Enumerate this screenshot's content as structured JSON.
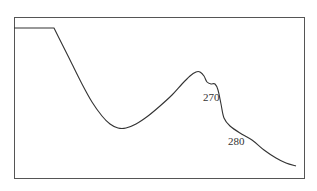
{
  "chart_data": {
    "type": "line",
    "title": "",
    "xlabel": "",
    "ylabel": "",
    "grid": false,
    "legend": null,
    "annotations": [
      {
        "text": "270",
        "x": 203,
        "y": 101
      },
      {
        "text": "280",
        "x": 228,
        "y": 145
      }
    ],
    "frame": {
      "left": 14,
      "top": 17,
      "right": 304,
      "bottom": 178
    },
    "series": [
      {
        "name": "spectrum",
        "color": "#333333",
        "points": [
          [
            14,
            28
          ],
          [
            54,
            28
          ],
          [
            62,
            44
          ],
          [
            72,
            64
          ],
          [
            82,
            84
          ],
          [
            92,
            102
          ],
          [
            102,
            116
          ],
          [
            110,
            124
          ],
          [
            118,
            128
          ],
          [
            126,
            128
          ],
          [
            136,
            124
          ],
          [
            148,
            116
          ],
          [
            160,
            106
          ],
          [
            172,
            95
          ],
          [
            182,
            84
          ],
          [
            190,
            76
          ],
          [
            196,
            72
          ],
          [
            200,
            72
          ],
          [
            204,
            76
          ],
          [
            207,
            82
          ],
          [
            211,
            84
          ],
          [
            215,
            84
          ],
          [
            218,
            90
          ],
          [
            221,
            104
          ],
          [
            224,
            118
          ],
          [
            230,
            126
          ],
          [
            240,
            133
          ],
          [
            252,
            140
          ],
          [
            264,
            150
          ],
          [
            276,
            158
          ],
          [
            286,
            163
          ],
          [
            296,
            166
          ]
        ]
      }
    ]
  }
}
